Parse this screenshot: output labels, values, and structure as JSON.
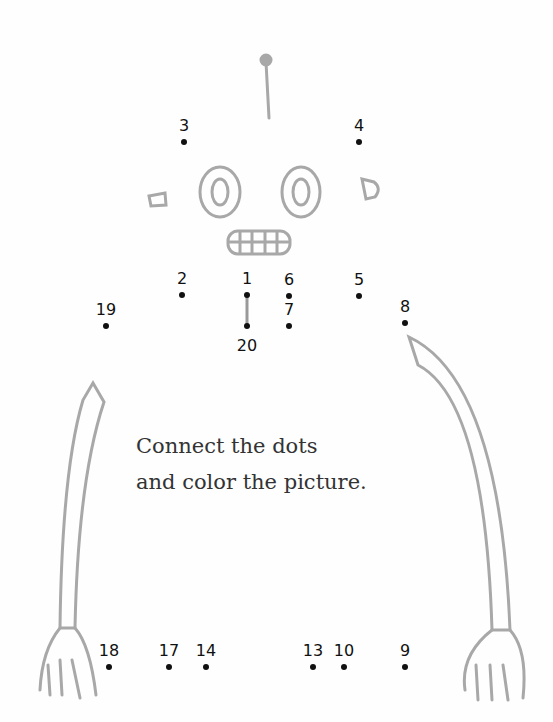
{
  "instructions": {
    "line1": "Connect the dots",
    "line2": "and color the picture."
  },
  "colors": {
    "drawing": "#a8a8a8",
    "dots": "#111111",
    "text": "#333333"
  },
  "dots": [
    {
      "label": "1",
      "x": 247,
      "y": 295
    },
    {
      "label": "2",
      "x": 182,
      "y": 295
    },
    {
      "label": "3",
      "x": 184,
      "y": 142
    },
    {
      "label": "4",
      "x": 359,
      "y": 142
    },
    {
      "label": "5",
      "x": 359,
      "y": 296
    },
    {
      "label": "6",
      "x": 289,
      "y": 296
    },
    {
      "label": "7",
      "x": 289,
      "y": 326
    },
    {
      "label": "8",
      "x": 405,
      "y": 323
    },
    {
      "label": "9",
      "x": 405,
      "y": 667
    },
    {
      "label": "10",
      "x": 344,
      "y": 667
    },
    {
      "label": "13",
      "x": 313,
      "y": 667
    },
    {
      "label": "14",
      "x": 206,
      "y": 667
    },
    {
      "label": "17",
      "x": 169,
      "y": 667
    },
    {
      "label": "18",
      "x": 109,
      "y": 667
    },
    {
      "label": "19",
      "x": 106,
      "y": 326
    },
    {
      "label": "20",
      "x": 247,
      "y": 326
    }
  ]
}
